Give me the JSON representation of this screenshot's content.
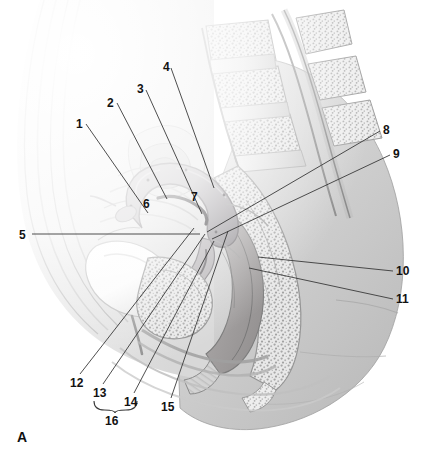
{
  "figure": {
    "panel_letter": "A",
    "orientation": "midsagittal section, female pelvis",
    "background_color": "#ffffff",
    "line_color": "#3a3a3a",
    "text_color": "#121212",
    "width": 432,
    "height": 457
  },
  "labels": [
    {
      "id": "1",
      "text": "1",
      "x": 76,
      "y": 118,
      "line": [
        [
          86,
          124
        ],
        [
          148,
          213
        ]
      ]
    },
    {
      "id": "2",
      "text": "2",
      "x": 107,
      "y": 97,
      "line": [
        [
          117,
          103
        ],
        [
          167,
          199
        ]
      ]
    },
    {
      "id": "3",
      "text": "3",
      "x": 137,
      "y": 83,
      "line": [
        [
          146,
          90
        ],
        [
          202,
          214
        ]
      ]
    },
    {
      "id": "4",
      "text": "4",
      "x": 163,
      "y": 61,
      "line": [
        [
          171,
          68
        ],
        [
          214,
          188
        ]
      ]
    },
    {
      "id": "5",
      "text": "5",
      "x": 19,
      "y": 229,
      "line": [
        [
          32,
          234
        ],
        [
          200,
          234
        ]
      ]
    },
    {
      "id": "6",
      "text": "6",
      "x": 143,
      "y": 198,
      "line": null
    },
    {
      "id": "7",
      "text": "7",
      "x": 191,
      "y": 191,
      "line": null
    },
    {
      "id": "8",
      "text": "8",
      "x": 383,
      "y": 124,
      "line": [
        [
          380,
          131
        ],
        [
          207,
          232
        ]
      ]
    },
    {
      "id": "9",
      "text": "9",
      "x": 393,
      "y": 148,
      "line": [
        [
          390,
          155
        ],
        [
          212,
          239
        ]
      ]
    },
    {
      "id": "10",
      "text": "10",
      "x": 396,
      "y": 265,
      "line": [
        [
          393,
          271
        ],
        [
          258,
          257
        ]
      ]
    },
    {
      "id": "11",
      "text": "11",
      "x": 396,
      "y": 293,
      "line": [
        [
          393,
          299
        ],
        [
          249,
          268
        ]
      ]
    },
    {
      "id": "12",
      "text": "12",
      "x": 70,
      "y": 377,
      "line": [
        [
          80,
          374
        ],
        [
          194,
          228
        ]
      ]
    },
    {
      "id": "13",
      "text": "13",
      "x": 93,
      "y": 387,
      "line": [
        [
          103,
          384
        ],
        [
          205,
          234
        ]
      ]
    },
    {
      "id": "14",
      "text": "14",
      "x": 124,
      "y": 396,
      "line": [
        [
          134,
          393
        ],
        [
          214,
          241
        ]
      ]
    },
    {
      "id": "15",
      "text": "15",
      "x": 161,
      "y": 401,
      "line": [
        [
          171,
          398
        ],
        [
          228,
          231
        ]
      ]
    },
    {
      "id": "16",
      "text": "16",
      "x": 105,
      "y": 415,
      "line": null
    }
  ],
  "bracket": {
    "name": "grouping-bracket-16",
    "left_x": 94,
    "right_x": 137,
    "top_y": 401,
    "depth_y": 410,
    "tip_x": 115,
    "tip_y": 413
  }
}
